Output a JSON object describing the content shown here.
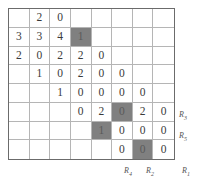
{
  "figure": {
    "type": "matrix-grid",
    "rows": 8,
    "columns": 8,
    "shade_color": "#808080",
    "border_color": "#6b6b6b",
    "gridline_color": "#b5b5b5",
    "cells": [
      [
        {
          "value": "",
          "shaded": false
        },
        {
          "value": "2",
          "shaded": false
        },
        {
          "value": "0",
          "shaded": false
        },
        {
          "value": "",
          "shaded": false
        },
        {
          "value": "",
          "shaded": false
        },
        {
          "value": "",
          "shaded": false
        },
        {
          "value": "",
          "shaded": false
        },
        {
          "value": "",
          "shaded": false
        }
      ],
      [
        {
          "value": "3",
          "shaded": false
        },
        {
          "value": "3",
          "shaded": false
        },
        {
          "value": "4",
          "shaded": false
        },
        {
          "value": "1",
          "shaded": true
        },
        {
          "value": "",
          "shaded": false
        },
        {
          "value": "",
          "shaded": false
        },
        {
          "value": "",
          "shaded": false
        },
        {
          "value": "",
          "shaded": false
        }
      ],
      [
        {
          "value": "2",
          "shaded": false
        },
        {
          "value": "0",
          "shaded": false
        },
        {
          "value": "2",
          "shaded": false
        },
        {
          "value": "2",
          "shaded": false
        },
        {
          "value": "0",
          "shaded": false
        },
        {
          "value": "",
          "shaded": false
        },
        {
          "value": "",
          "shaded": false
        },
        {
          "value": "",
          "shaded": false
        }
      ],
      [
        {
          "value": "",
          "shaded": false
        },
        {
          "value": "1",
          "shaded": false
        },
        {
          "value": "0",
          "shaded": false
        },
        {
          "value": "2",
          "shaded": false
        },
        {
          "value": "0",
          "shaded": false
        },
        {
          "value": "0",
          "shaded": false
        },
        {
          "value": "",
          "shaded": false
        },
        {
          "value": "",
          "shaded": false
        }
      ],
      [
        {
          "value": "",
          "shaded": false
        },
        {
          "value": "",
          "shaded": false
        },
        {
          "value": "1",
          "shaded": false
        },
        {
          "value": "0",
          "shaded": false
        },
        {
          "value": "0",
          "shaded": false
        },
        {
          "value": "0",
          "shaded": false
        },
        {
          "value": "0",
          "shaded": false
        },
        {
          "value": "",
          "shaded": false
        }
      ],
      [
        {
          "value": "",
          "shaded": false
        },
        {
          "value": "",
          "shaded": false
        },
        {
          "value": "",
          "shaded": false
        },
        {
          "value": "0",
          "shaded": false
        },
        {
          "value": "2",
          "shaded": false
        },
        {
          "value": "0",
          "shaded": true
        },
        {
          "value": "2",
          "shaded": false
        },
        {
          "value": "0",
          "shaded": false
        }
      ],
      [
        {
          "value": "",
          "shaded": false
        },
        {
          "value": "",
          "shaded": false
        },
        {
          "value": "",
          "shaded": false
        },
        {
          "value": "",
          "shaded": false
        },
        {
          "value": "1",
          "shaded": true
        },
        {
          "value": "0",
          "shaded": false
        },
        {
          "value": "0",
          "shaded": false
        },
        {
          "value": "0",
          "shaded": false
        }
      ],
      [
        {
          "value": "",
          "shaded": false
        },
        {
          "value": "",
          "shaded": false
        },
        {
          "value": "",
          "shaded": false
        },
        {
          "value": "",
          "shaded": false
        },
        {
          "value": "",
          "shaded": false
        },
        {
          "value": "0",
          "shaded": false
        },
        {
          "value": "0",
          "shaded": true
        },
        {
          "value": "0",
          "shaded": false
        }
      ]
    ]
  },
  "labels": {
    "right": [
      {
        "base": "R",
        "sub": "3"
      },
      {
        "base": "R",
        "sub": "5"
      },
      {
        "base": "R",
        "sub": "1"
      }
    ],
    "bottom": [
      {
        "base": "R",
        "sub": "4"
      },
      {
        "base": "R",
        "sub": "2"
      }
    ]
  }
}
